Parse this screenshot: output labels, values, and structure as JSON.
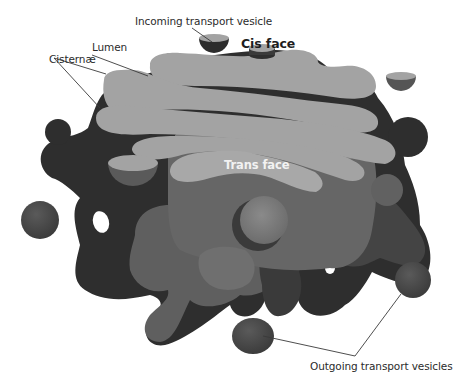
{
  "diagram": {
    "colors": {
      "background": "#ffffff",
      "membrane_dark": "#2f2f2f",
      "membrane_mid": "#474747",
      "cisterna_light": "#a3a3a3",
      "trans_body": "#6a6a6a",
      "trans_body_light": "#7e7e7e",
      "vesicle": "#4a4a4a",
      "label_text": "#2b2b2b",
      "leader_line": "#3a3a3a",
      "trans_label": "#f2f2f2"
    },
    "labels": {
      "incoming_vesicle": "Incoming transport vesicle",
      "cis_face": "Cis face",
      "lumen": "Lumen",
      "cisternae": "Cisternæ",
      "trans_face": "Trans face",
      "outgoing_vesicles": "Outgoing transport vesicles"
    }
  }
}
